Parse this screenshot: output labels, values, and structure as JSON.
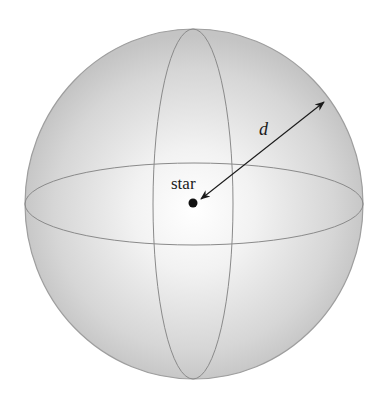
{
  "diagram": {
    "labels": {
      "center": "star",
      "distance": "d"
    },
    "colors": {
      "sphere_edge": "#a8a8a8",
      "sphere_center": "#ffffff",
      "sphere_rim": "#bdbdbd",
      "great_circle": "#8a8a8a",
      "arrow": "#1a1a1a",
      "star": "#111111"
    }
  }
}
